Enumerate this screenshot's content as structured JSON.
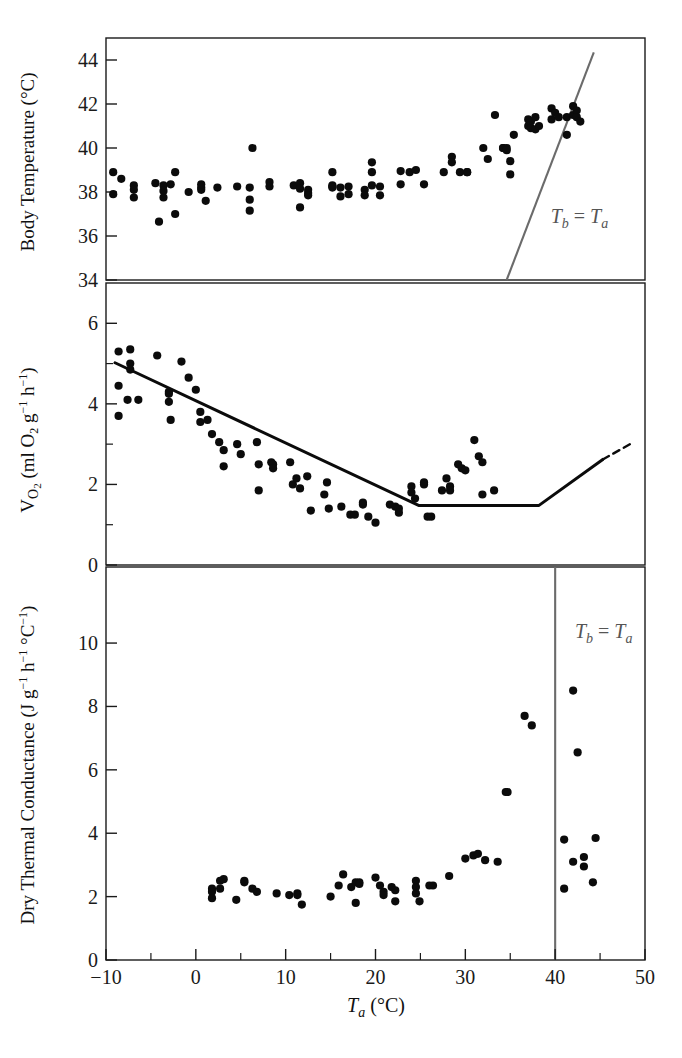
{
  "figure": {
    "width": 682,
    "height": 1058,
    "background": "#ffffff",
    "point_color": "#0b0b0b",
    "fit_color": "#0b0b0b",
    "iso_color": "#6b6b6b",
    "axis_color": "#1a1a1a"
  },
  "shared": {
    "xlabel_main": "T",
    "xlabel_sub": "a",
    "xlabel_unit": "(°C)",
    "x_ticks": [
      -10,
      0,
      10,
      20,
      30,
      40,
      50
    ],
    "x_tick_labels": [
      "−10",
      "0",
      "10",
      "20",
      "30",
      "40",
      "50"
    ],
    "x_minor_ticks": [
      -5,
      5,
      15,
      25,
      35,
      45
    ],
    "xlim": [
      -10,
      50
    ]
  },
  "chart_data": [
    {
      "id": "panel-body-temperature",
      "type": "scatter",
      "title": "",
      "xlabel": "Ta (°C)",
      "ylabel": "Body Temperature (°C)",
      "ylabel_parts": {
        "text": "Body Temperature (°C)"
      },
      "xlim": [
        -10,
        50
      ],
      "ylim": [
        34,
        45
      ],
      "y_ticks": [
        34,
        36,
        38,
        40,
        42,
        44
      ],
      "y_tick_labels": [
        "34",
        "36",
        "38",
        "40",
        "42",
        "44"
      ],
      "y_minor_ticks": [],
      "grid": false,
      "legend": "none",
      "annotations": [
        {
          "name": "tb-equals-ta-label",
          "text": "T",
          "sub": "b",
          "mid": " = ",
          "text2": "T",
          "sub2": "a",
          "x": 39.5,
          "y": 36.6,
          "color": "#6b6b6b"
        }
      ],
      "reference_line": {
        "name": "tb-equals-ta-line",
        "kind": "identity",
        "x0": 34.6,
        "y0": 34.0,
        "x1": 44.3,
        "y1": 44.35,
        "color": "#6b6b6b"
      },
      "points": [
        [
          -9.2,
          38.9
        ],
        [
          -9.2,
          37.9
        ],
        [
          -8.3,
          38.6
        ],
        [
          -6.9,
          38.3
        ],
        [
          -6.9,
          38.1
        ],
        [
          -6.9,
          37.75
        ],
        [
          -4.5,
          38.4
        ],
        [
          -3.6,
          38.3
        ],
        [
          -3.6,
          38.05
        ],
        [
          -3.6,
          37.75
        ],
        [
          -2.8,
          38.35
        ],
        [
          -2.3,
          38.9
        ],
        [
          -2.3,
          37.0
        ],
        [
          -4.1,
          36.65
        ],
        [
          -0.8,
          38.0
        ],
        [
          0.6,
          38.2
        ],
        [
          0.6,
          38.1
        ],
        [
          0.6,
          38.35
        ],
        [
          1.1,
          37.6
        ],
        [
          2.4,
          38.2
        ],
        [
          4.6,
          38.25
        ],
        [
          6.0,
          38.2
        ],
        [
          6.0,
          37.65
        ],
        [
          6.0,
          37.15
        ],
        [
          6.3,
          40.0
        ],
        [
          8.2,
          38.45
        ],
        [
          8.2,
          38.25
        ],
        [
          10.9,
          38.3
        ],
        [
          11.6,
          38.4
        ],
        [
          11.6,
          38.15
        ],
        [
          11.6,
          37.3
        ],
        [
          12.5,
          38.1
        ],
        [
          12.5,
          37.95
        ],
        [
          12.5,
          37.85
        ],
        [
          15.2,
          38.9
        ],
        [
          15.2,
          38.3
        ],
        [
          15.2,
          38.25
        ],
        [
          15.2,
          38.2
        ],
        [
          16.1,
          38.2
        ],
        [
          16.1,
          37.8
        ],
        [
          17.0,
          38.25
        ],
        [
          17.0,
          37.9
        ],
        [
          18.8,
          38.1
        ],
        [
          18.8,
          37.85
        ],
        [
          19.6,
          39.35
        ],
        [
          19.6,
          38.9
        ],
        [
          19.6,
          38.3
        ],
        [
          20.5,
          38.25
        ],
        [
          20.5,
          37.85
        ],
        [
          22.8,
          38.95
        ],
        [
          22.8,
          38.35
        ],
        [
          23.8,
          38.9
        ],
        [
          24.5,
          39.0
        ],
        [
          25.4,
          38.35
        ],
        [
          27.6,
          38.9
        ],
        [
          28.5,
          39.6
        ],
        [
          28.5,
          39.35
        ],
        [
          29.4,
          38.9
        ],
        [
          30.2,
          38.9
        ],
        [
          30.2,
          38.9
        ],
        [
          32.0,
          40.0
        ],
        [
          32.5,
          39.5
        ],
        [
          33.3,
          41.5
        ],
        [
          34.2,
          40.0
        ],
        [
          34.2,
          40.0
        ],
        [
          34.6,
          40.0
        ],
        [
          34.6,
          39.9
        ],
        [
          35.0,
          39.4
        ],
        [
          35.0,
          38.8
        ],
        [
          35.4,
          40.6
        ],
        [
          37.0,
          41.3
        ],
        [
          37.0,
          41.0
        ],
        [
          37.3,
          41.2
        ],
        [
          37.3,
          40.9
        ],
        [
          37.8,
          41.4
        ],
        [
          37.8,
          40.85
        ],
        [
          38.2,
          41.0
        ],
        [
          39.6,
          41.8
        ],
        [
          39.6,
          41.3
        ],
        [
          40.0,
          41.6
        ],
        [
          40.4,
          41.4
        ],
        [
          41.3,
          41.4
        ],
        [
          41.3,
          40.6
        ],
        [
          42.0,
          41.9
        ],
        [
          42.0,
          41.5
        ],
        [
          42.4,
          41.7
        ],
        [
          42.4,
          41.4
        ],
        [
          42.8,
          41.2
        ]
      ]
    },
    {
      "id": "panel-oxygen-consumption",
      "type": "scatter",
      "title": "",
      "xlabel": "Ta (°C)",
      "ylabel": "Vo2 (ml O2 g−1 h−1)",
      "ylim": [
        0,
        7
      ],
      "y_ticks": [
        0,
        2,
        4,
        6
      ],
      "y_tick_labels": [
        "0",
        "2",
        "4",
        "6"
      ],
      "y_minor_ticks": [
        1,
        3,
        5
      ],
      "grid": false,
      "legend": "none",
      "fit": {
        "name": "piecewise-regression",
        "solid_vertices": [
          [
            -9.0,
            5.02
          ],
          [
            24.8,
            1.48
          ],
          [
            38.2,
            1.48
          ],
          [
            45.3,
            2.62
          ]
        ],
        "dashed_vertices": [
          [
            45.3,
            2.62
          ],
          [
            48.5,
            3.02
          ]
        ]
      },
      "points": [
        [
          -8.6,
          5.3
        ],
        [
          -8.6,
          4.45
        ],
        [
          -8.6,
          3.7
        ],
        [
          -7.3,
          5.35
        ],
        [
          -7.3,
          5.0
        ],
        [
          -7.3,
          4.85
        ],
        [
          -7.6,
          4.1
        ],
        [
          -6.4,
          4.1
        ],
        [
          -4.3,
          5.2
        ],
        [
          -3.0,
          4.3
        ],
        [
          -3.0,
          4.25
        ],
        [
          -3.0,
          4.05
        ],
        [
          -2.8,
          3.6
        ],
        [
          -1.6,
          5.05
        ],
        [
          -0.8,
          4.65
        ],
        [
          0.0,
          4.35
        ],
        [
          0.5,
          3.8
        ],
        [
          0.5,
          3.55
        ],
        [
          1.3,
          3.6
        ],
        [
          1.8,
          3.25
        ],
        [
          2.6,
          3.05
        ],
        [
          3.1,
          2.85
        ],
        [
          3.1,
          2.45
        ],
        [
          4.6,
          3.0
        ],
        [
          5.0,
          2.75
        ],
        [
          6.8,
          3.05
        ],
        [
          7.0,
          2.5
        ],
        [
          7.0,
          1.85
        ],
        [
          8.4,
          2.55
        ],
        [
          8.6,
          2.5
        ],
        [
          8.6,
          2.4
        ],
        [
          10.5,
          2.55
        ],
        [
          10.8,
          2.0
        ],
        [
          11.2,
          2.15
        ],
        [
          11.6,
          1.9
        ],
        [
          12.4,
          2.2
        ],
        [
          12.8,
          1.35
        ],
        [
          14.3,
          1.75
        ],
        [
          14.6,
          2.05
        ],
        [
          14.8,
          1.4
        ],
        [
          16.2,
          1.45
        ],
        [
          17.2,
          1.25
        ],
        [
          17.7,
          1.25
        ],
        [
          18.6,
          1.55
        ],
        [
          18.6,
          1.5
        ],
        [
          19.2,
          1.2
        ],
        [
          20.0,
          1.05
        ],
        [
          21.6,
          1.5
        ],
        [
          22.2,
          1.45
        ],
        [
          22.6,
          1.4
        ],
        [
          22.6,
          1.3
        ],
        [
          24.0,
          1.95
        ],
        [
          24.0,
          1.8
        ],
        [
          24.4,
          1.65
        ],
        [
          25.4,
          2.05
        ],
        [
          25.4,
          2.0
        ],
        [
          25.8,
          1.2
        ],
        [
          26.2,
          1.2
        ],
        [
          27.4,
          1.85
        ],
        [
          27.9,
          2.15
        ],
        [
          28.3,
          1.95
        ],
        [
          28.3,
          1.85
        ],
        [
          29.2,
          2.5
        ],
        [
          29.6,
          2.4
        ],
        [
          30.0,
          2.35
        ],
        [
          31.0,
          3.1
        ],
        [
          31.5,
          2.7
        ],
        [
          31.9,
          2.55
        ],
        [
          31.9,
          1.75
        ],
        [
          33.2,
          1.85
        ]
      ]
    },
    {
      "id": "panel-thermal-conductance",
      "type": "scatter",
      "title": "",
      "xlabel": "Ta (°C)",
      "ylabel": "Dry Thermal Conductance (Jg−1 h−1 °C−1)",
      "ylim": [
        0,
        12.4
      ],
      "y_ticks": [
        0,
        2,
        4,
        6,
        8,
        10
      ],
      "y_tick_labels": [
        "0",
        "2",
        "4",
        "6",
        "8",
        "10"
      ],
      "y_minor_ticks": [],
      "grid": false,
      "legend": "none",
      "reference_line": {
        "name": "tb-equals-ta-line",
        "kind": "vertical",
        "x": 40.0,
        "color": "#6b6b6b"
      },
      "annotations": [
        {
          "name": "tb-equals-ta-label",
          "text": "T",
          "sub": "b",
          "mid": " = ",
          "text2": "T",
          "sub2": "a",
          "x": 42.2,
          "y": 10.15,
          "color": "#555555"
        }
      ],
      "points": [
        [
          1.8,
          2.25
        ],
        [
          1.8,
          2.15
        ],
        [
          1.8,
          1.95
        ],
        [
          2.7,
          2.5
        ],
        [
          2.7,
          2.25
        ],
        [
          3.1,
          2.55
        ],
        [
          4.5,
          1.9
        ],
        [
          5.4,
          2.5
        ],
        [
          5.4,
          2.45
        ],
        [
          6.3,
          2.25
        ],
        [
          6.8,
          2.15
        ],
        [
          9.0,
          2.1
        ],
        [
          10.4,
          2.05
        ],
        [
          11.3,
          2.1
        ],
        [
          11.3,
          2.05
        ],
        [
          11.8,
          1.75
        ],
        [
          15.0,
          2.0
        ],
        [
          15.9,
          2.35
        ],
        [
          16.4,
          2.7
        ],
        [
          17.3,
          2.3
        ],
        [
          17.8,
          2.45
        ],
        [
          18.2,
          2.45
        ],
        [
          18.2,
          2.4
        ],
        [
          17.8,
          1.8
        ],
        [
          20.0,
          2.6
        ],
        [
          20.5,
          2.35
        ],
        [
          20.9,
          2.15
        ],
        [
          20.9,
          2.05
        ],
        [
          21.8,
          2.3
        ],
        [
          22.2,
          2.2
        ],
        [
          22.2,
          1.85
        ],
        [
          24.5,
          2.5
        ],
        [
          24.5,
          2.3
        ],
        [
          24.5,
          2.1
        ],
        [
          24.9,
          1.85
        ],
        [
          26.0,
          2.35
        ],
        [
          26.4,
          2.35
        ],
        [
          28.2,
          2.65
        ],
        [
          30.0,
          3.2
        ],
        [
          30.9,
          3.3
        ],
        [
          31.4,
          3.35
        ],
        [
          32.2,
          3.15
        ],
        [
          33.6,
          3.1
        ],
        [
          34.5,
          5.3
        ],
        [
          34.7,
          5.3
        ],
        [
          36.6,
          7.7
        ],
        [
          37.4,
          7.4
        ],
        [
          41.0,
          3.8
        ],
        [
          41.0,
          2.25
        ],
        [
          42.0,
          8.5
        ],
        [
          42.0,
          3.1
        ],
        [
          42.5,
          6.55
        ],
        [
          43.2,
          3.25
        ],
        [
          43.2,
          2.95
        ],
        [
          44.5,
          3.85
        ],
        [
          44.2,
          2.45
        ]
      ]
    }
  ]
}
